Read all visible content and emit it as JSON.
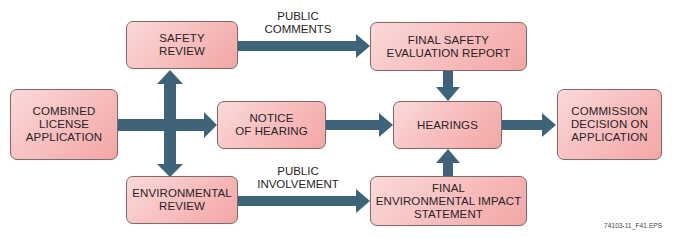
{
  "diagram": {
    "type": "flowchart",
    "nodes": [
      {
        "id": "col",
        "label": "COMBINED\nLICENSE\nAPPLICATION"
      },
      {
        "id": "safety",
        "label": "SAFETY\nREVIEW"
      },
      {
        "id": "notice",
        "label": "NOTICE\nOF HEARING"
      },
      {
        "id": "env",
        "label": "ENVIRONMENTAL\nREVIEW"
      },
      {
        "id": "fser",
        "label": "FINAL SAFETY\nEVALUATION REPORT"
      },
      {
        "id": "hearings",
        "label": "HEARINGS"
      },
      {
        "id": "feis",
        "label": "FINAL\nENVIRONMENTAL IMPACT\nSTATEMENT"
      },
      {
        "id": "decision",
        "label": "COMMISSION\nDECISION ON\nAPPLICATION"
      }
    ],
    "edges": [
      {
        "from": "col",
        "to": "safety"
      },
      {
        "from": "col",
        "to": "notice"
      },
      {
        "from": "col",
        "to": "env"
      },
      {
        "from": "safety",
        "to": "fser",
        "label": "PUBLIC\nCOMMENTS"
      },
      {
        "from": "env",
        "to": "feis",
        "label": "PUBLIC\nINVOLVEMENT"
      },
      {
        "from": "notice",
        "to": "hearings"
      },
      {
        "from": "fser",
        "to": "hearings"
      },
      {
        "from": "feis",
        "to": "hearings"
      },
      {
        "from": "hearings",
        "to": "decision"
      }
    ],
    "edge_labels": {
      "public_comments": "PUBLIC\nCOMMENTS",
      "public_involvement": "PUBLIC\nINVOLVEMENT"
    },
    "figure_id": "74103-11_F41.EPS",
    "colors": {
      "box_fill": "#f7bcbc",
      "box_border": "#7d6b6b",
      "arrow": "#3f6379",
      "text": "#2a2326"
    }
  }
}
